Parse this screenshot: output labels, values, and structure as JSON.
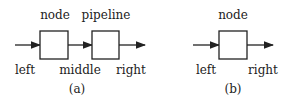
{
  "diagram_a": {
    "top_labels": [
      "node",
      "pipeline"
    ],
    "bottom_labels": [
      "left",
      "middle",
      "right"
    ],
    "caption": "(a)"
  },
  "diagram_b": {
    "top_labels": [
      "node"
    ],
    "bottom_labels": [
      "left",
      "right"
    ],
    "caption": "(b)"
  },
  "colors": {
    "stroke": "#222222",
    "background": "#ffffff"
  }
}
